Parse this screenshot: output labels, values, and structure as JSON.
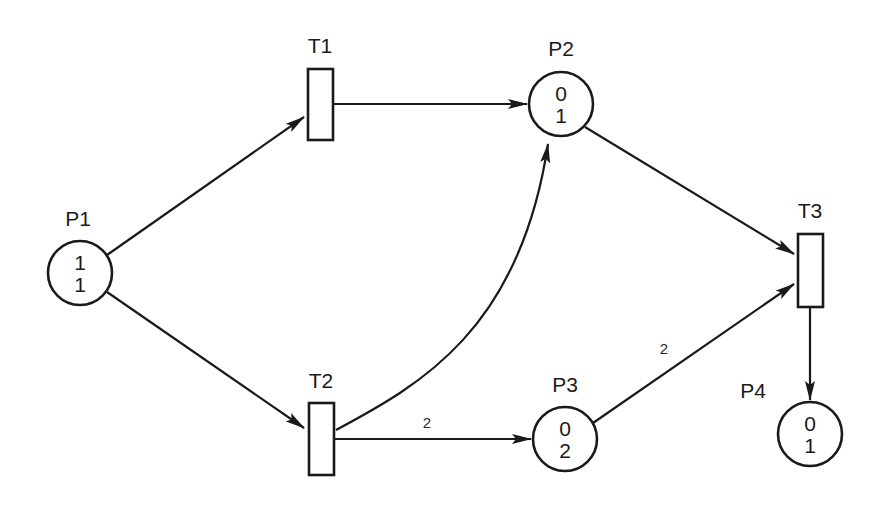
{
  "diagram": {
    "type": "petri-net",
    "colors": {
      "ink": "#1a1a1a",
      "background": "#ffffff"
    },
    "places": [
      {
        "id": "P1",
        "label": "P1",
        "tokens": [
          "1",
          "1"
        ],
        "cx": 80,
        "cy": 273,
        "r": 32,
        "label_x": 78,
        "label_y": 226
      },
      {
        "id": "P2",
        "label": "P2",
        "tokens": [
          "0",
          "1"
        ],
        "cx": 561,
        "cy": 104,
        "r": 32,
        "label_x": 561,
        "label_y": 56
      },
      {
        "id": "P3",
        "label": "P3",
        "tokens": [
          "0",
          "2"
        ],
        "cx": 565,
        "cy": 439,
        "r": 32,
        "label_x": 565,
        "label_y": 392
      },
      {
        "id": "P4",
        "label": "P4",
        "tokens": [
          "0",
          "1"
        ],
        "cx": 810,
        "cy": 434,
        "r": 32,
        "label_x": 753,
        "label_y": 398
      }
    ],
    "transitions": [
      {
        "id": "T1",
        "label": "T1",
        "x": 308,
        "y": 69,
        "w": 25,
        "h": 71,
        "label_x": 320,
        "label_y": 53
      },
      {
        "id": "T2",
        "label": "T2",
        "x": 309,
        "y": 403,
        "w": 25,
        "h": 72,
        "label_x": 321,
        "label_y": 388
      },
      {
        "id": "T3",
        "label": "T3",
        "x": 798,
        "y": 234,
        "w": 25,
        "h": 73,
        "label_x": 810,
        "label_y": 218
      }
    ],
    "arcs": [
      {
        "from": "P1",
        "to": "T1",
        "weight": "",
        "path": "M 107 255 L 304 117"
      },
      {
        "from": "P1",
        "to": "T2",
        "weight": "",
        "path": "M 107 292 L 304 428"
      },
      {
        "from": "T1",
        "to": "P2",
        "weight": "",
        "path": "M 334 104 L 527 104"
      },
      {
        "from": "T2",
        "to": "P2",
        "weight": "",
        "path": "M 336 430 C 420 385, 520 330, 548 144"
      },
      {
        "from": "T2",
        "to": "P3",
        "weight": "2",
        "path": "M 335 439 L 531 439",
        "weight_x": 427,
        "weight_y": 428
      },
      {
        "from": "P2",
        "to": "T3",
        "weight": "",
        "path": "M 585 127 L 794 254"
      },
      {
        "from": "P3",
        "to": "T3",
        "weight": "2",
        "path": "M 593 423 L 794 284",
        "weight_x": 664,
        "weight_y": 354
      },
      {
        "from": "T3",
        "to": "P4",
        "weight": "",
        "path": "M 810 308 L 810 400"
      }
    ]
  }
}
